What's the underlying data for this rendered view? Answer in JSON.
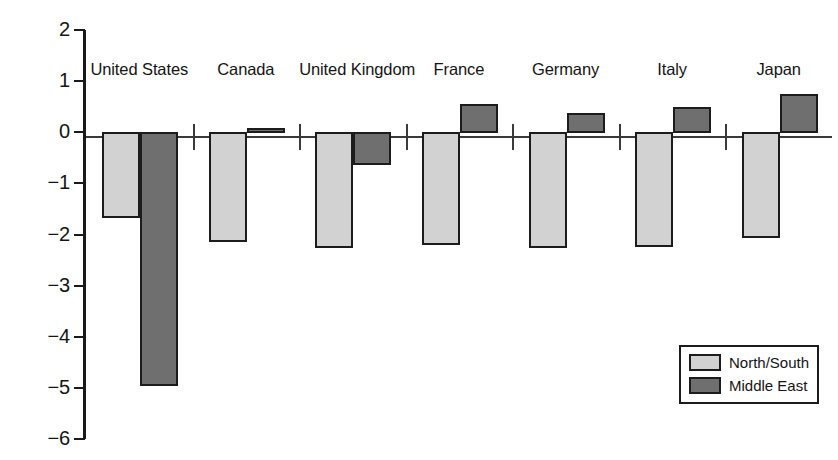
{
  "chart_data": {
    "type": "bar",
    "title": "",
    "subtitle": "",
    "xlabel": "",
    "ylabel": "",
    "categories": [
      "United States",
      "Canada",
      "United Kingdom",
      "France",
      "Germany",
      "Italy",
      "Japan"
    ],
    "series": [
      {
        "name": "North/South",
        "color": "#d2d2d2",
        "values": [
          -1.65,
          -2.12,
          -2.25,
          -2.18,
          -2.25,
          -2.23,
          -2.05
        ]
      },
      {
        "name": "Middle East",
        "color": "#6f6f6f",
        "values": [
          -4.95,
          0.08,
          -0.63,
          0.55,
          0.37,
          0.5,
          0.75
        ]
      }
    ],
    "ylim": [
      -6,
      2
    ],
    "yticks": [
      2,
      1,
      0,
      -1,
      -2,
      -3,
      -4,
      -5,
      -6
    ],
    "ytick_labels": [
      "2",
      "1",
      "0",
      "−1",
      "−2",
      "−3",
      "−4",
      "−5",
      "−6"
    ],
    "grid": false,
    "legend_position": "bottom-right",
    "zero_line": true
  },
  "legend": {
    "entries": [
      {
        "label": "North/South",
        "swatch": "light-gray-swatch"
      },
      {
        "label": "Middle East",
        "swatch": "dark-gray-swatch"
      }
    ]
  }
}
